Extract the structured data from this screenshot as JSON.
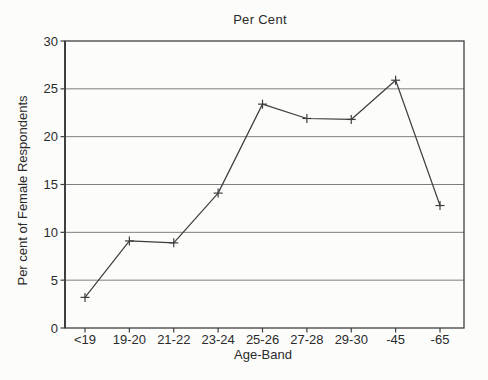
{
  "chart_data": {
    "type": "line",
    "title": "Per Cent",
    "xlabel": "Age-Band",
    "ylabel": "Per cent of Female Respondents",
    "categories": [
      "<19",
      "19-20",
      "21-22",
      "23-24",
      "25-26",
      "27-28",
      "29-30",
      "-45",
      "-65"
    ],
    "values": [
      3.2,
      9.1,
      8.9,
      14.1,
      23.4,
      21.9,
      21.8,
      25.9,
      12.8
    ],
    "ylim": [
      0,
      30
    ],
    "yticks": [
      0,
      5,
      10,
      15,
      20,
      25,
      30
    ],
    "grid": "horizontal",
    "legend": "none",
    "marker": "plus",
    "series_name": "Per cent of Female Respondents",
    "colors": {
      "line": "#3d3d3d",
      "grid": "#6f6f6f",
      "frame": "#3f3f3f",
      "text": "#2b2b2b",
      "background": "#fcfcfb"
    }
  }
}
